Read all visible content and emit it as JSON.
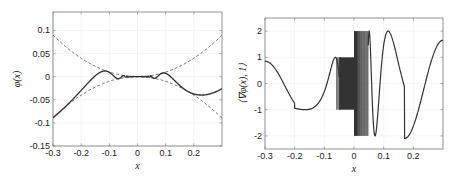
{
  "chart_data": [
    {
      "type": "line",
      "title": "",
      "xlabel": "x",
      "ylabel": "φ(x)",
      "xlim": [
        -0.3,
        0.3
      ],
      "ylim": [
        -0.15,
        0.14
      ],
      "xticks": [
        -0.3,
        -0.2,
        -0.1,
        0,
        0.1,
        0.2
      ],
      "xtick_labels": [
        "-0.3",
        "-0.2",
        "-0.1",
        "0",
        "0.1",
        "0.2"
      ],
      "yticks": [
        0.1,
        0.05,
        0,
        -0.05,
        -0.1,
        -0.15
      ],
      "ytick_labels": [
        "0.1",
        "0.05",
        "0",
        "-0.05",
        "-0.1",
        "-0.15"
      ],
      "grid": true,
      "series": [
        {
          "name": "φ(x)",
          "style": "solid",
          "description": "x^2 sin(...) type oscillation bounded by ±x^2 envelopes",
          "x": [
            -0.3,
            -0.27,
            -0.23,
            -0.2,
            -0.17,
            -0.13,
            -0.11,
            -0.09,
            -0.08,
            -0.07,
            -0.06,
            -0.05,
            0,
            0.05,
            0.06,
            0.07,
            0.08,
            0.1,
            0.12,
            0.135,
            0.16,
            0.2,
            0.235,
            0.27,
            0.3
          ],
          "y": [
            0.018,
            0.04,
            0.05,
            0.04,
            0.01,
            -0.017,
            -0.008,
            0.007,
            0.002,
            -0.004,
            0.002,
            0.0,
            0.0,
            0.0,
            -0.003,
            0.005,
            -0.006,
            -0.018,
            0.02,
            0.032,
            0.01,
            -0.06,
            -0.1,
            -0.085,
            -0.04
          ]
        },
        {
          "name": "x^2 envelope",
          "style": "dashed",
          "formula": "x^2"
        },
        {
          "name": "-x^2 envelope",
          "style": "dashed",
          "formula": "-x^2"
        }
      ]
    },
    {
      "type": "line",
      "title": "",
      "xlabel": "x",
      "ylabel": "⟨∇φ(x), 1⟩",
      "xlim": [
        -0.3,
        0.3
      ],
      "ylim": [
        -2.5,
        2.5
      ],
      "xticks": [
        -0.3,
        -0.2,
        -0.1,
        0,
        0.1,
        0.2
      ],
      "xtick_labels": [
        "-0.3",
        "-0.2",
        "-0.1",
        "0",
        "0.1",
        "0.2"
      ],
      "yticks": [
        2,
        1,
        0,
        -1,
        -2
      ],
      "ytick_labels": [
        "2",
        "1",
        "0",
        "-1",
        "-2"
      ],
      "grid": true,
      "series": [
        {
          "name": "gradient",
          "style": "solid",
          "x": [
            -0.3,
            -0.25,
            -0.2,
            -0.165,
            -0.13,
            -0.105,
            -0.085,
            -0.075,
            -0.065,
            -0.058,
            -0.05,
            0.0,
            0.04,
            0.05,
            0.06,
            0.07,
            0.085,
            0.1,
            0.115,
            0.14,
            0.17,
            0.2,
            0.25,
            0.3
          ],
          "y": [
            0.85,
            0.3,
            -0.5,
            -1.05,
            0.0,
            1.0,
            0.0,
            -1.0,
            0.0,
            1.0,
            -1.0,
            1.0,
            2.0,
            -2.0,
            2.0,
            -2.0,
            -2.0,
            0.5,
            2.0,
            0.0,
            -2.1,
            -1.5,
            0.2,
            1.65
          ],
          "dense_band_1": {
            "x_range": [
              -0.05,
              0.0
            ],
            "y_range": [
              -1,
              1
            ]
          },
          "dense_band_2": {
            "x_range": [
              0.0,
              0.045
            ],
            "y_range": [
              -2,
              2
            ]
          }
        }
      ]
    }
  ]
}
